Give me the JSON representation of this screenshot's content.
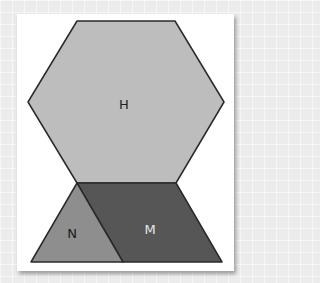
{
  "figure": {
    "shapes": [
      {
        "id": "hexagon",
        "label": "H",
        "fill": "#bdbdbd",
        "label_color": "#222222"
      },
      {
        "id": "triangle",
        "label": "N",
        "fill": "#8e8e8e",
        "label_color": "#1a1a1a"
      },
      {
        "id": "trapezoid",
        "label": "M",
        "fill": "#565656",
        "label_color": "#e6e6e6"
      }
    ],
    "stroke_color": "#2a2a2a",
    "background_color": "#ffffff"
  }
}
